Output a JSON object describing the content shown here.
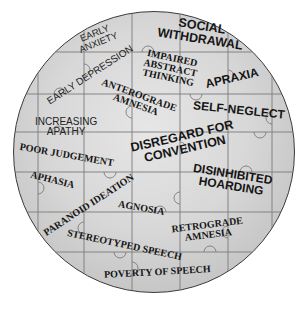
{
  "diagram": {
    "type": "jigsaw-puzzle-circle",
    "colors": {
      "background": "#ffffff",
      "puzzle_fill": "#d8d8d8",
      "puzzle_edge": "#3a3a3a",
      "piece_lines": "#7a7a7a",
      "text": "#151515"
    },
    "labels": {
      "social_withdrawal": "SOCIAL\nWITHDRAWAL",
      "early_anxiety": "EARLY\nANXIETY",
      "early_depression": "EARLY DEPRESSION",
      "impaired_abstract_thinking": "IMPAIRED\nABSTRACT\nTHINKING",
      "apraxia": "APRAXIA",
      "anterograde_amnesia": "ANTEROGRADE\nAMNESIA",
      "self_neglect": "SELF-NEGLECT",
      "increasing_apathy": "INCREASING\nAPATHY",
      "poor_judgement": "POOR JUDGEMENT",
      "disregard_for_convention": "DISREGARD FOR\nCONVENTION",
      "aphasia": "APHASIA",
      "paranoid_ideation": "PARANOID IDEATION",
      "disinhibited_hoarding": "DISINHIBITED\nHOARDING",
      "agnosia": "AGNOSIA",
      "retrograde_amnesia": "RETROGRADE\nAMNESIA",
      "stereotyped_speech": "STEREOTYPED SPEECH",
      "poverty_of_speech": "POVERTY OF SPEECH"
    }
  }
}
